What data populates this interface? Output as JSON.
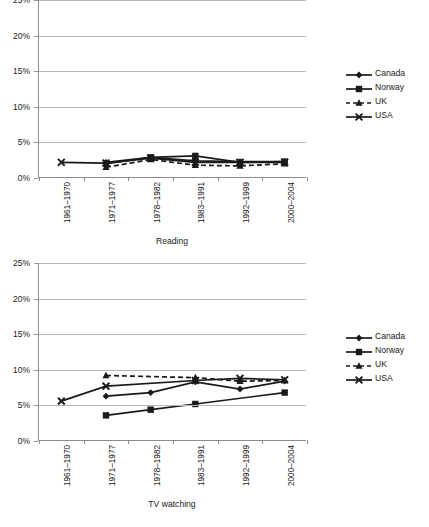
{
  "chart_data": [
    {
      "type": "line",
      "title": "",
      "xlabel": "Reading",
      "ylabel": "",
      "ylim": [
        0,
        25
      ],
      "yticks": [
        "0%",
        "5%",
        "10%",
        "15%",
        "20%",
        "25%"
      ],
      "ytick_values": [
        0,
        5,
        10,
        15,
        20,
        25
      ],
      "grid": true,
      "legend_position": "right",
      "categories": [
        "1961–1970",
        "1971–1977",
        "1978–1982",
        "1983–1991",
        "1992–1999",
        "2000–2004"
      ],
      "series": [
        {
          "name": "Canada",
          "marker": "diamond",
          "line": "solid",
          "values": [
            null,
            2.2,
            2.9,
            2.4,
            2.3,
            2.3
          ]
        },
        {
          "name": "Norway",
          "marker": "square",
          "line": "solid",
          "values": [
            null,
            2.0,
            2.9,
            3.1,
            2.2,
            2.3
          ]
        },
        {
          "name": "UK",
          "marker": "triangle",
          "line": "dashed",
          "values": [
            null,
            1.5,
            2.6,
            1.8,
            1.7,
            2.0
          ]
        },
        {
          "name": "USA",
          "marker": "x",
          "line": "solid",
          "values": [
            2.2,
            2.1,
            2.8,
            2.2,
            2.2,
            2.2
          ]
        }
      ]
    },
    {
      "type": "line",
      "title": "",
      "xlabel": "TV watching",
      "ylabel": "",
      "ylim": [
        0,
        25
      ],
      "yticks": [
        "0%",
        "5%",
        "10%",
        "15%",
        "20%",
        "25%"
      ],
      "ytick_values": [
        0,
        5,
        10,
        15,
        20,
        25
      ],
      "grid": true,
      "legend_position": "right",
      "categories": [
        "1961–1970",
        "1971–1977",
        "1978–1982",
        "1983–1991",
        "1992–1999",
        "2000–2004"
      ],
      "series": [
        {
          "name": "Canada",
          "marker": "diamond",
          "line": "solid",
          "values": [
            null,
            6.3,
            6.8,
            8.3,
            7.3,
            8.4
          ]
        },
        {
          "name": "Norway",
          "marker": "square",
          "line": "solid",
          "values": [
            null,
            3.6,
            4.4,
            5.2,
            null,
            6.8
          ]
        },
        {
          "name": "UK",
          "marker": "triangle",
          "line": "dashed",
          "values": [
            null,
            9.2,
            null,
            8.9,
            8.4,
            8.5
          ]
        },
        {
          "name": "USA",
          "marker": "x",
          "line": "solid",
          "values": [
            5.6,
            7.7,
            null,
            8.5,
            8.8,
            8.6
          ]
        }
      ]
    }
  ],
  "charts": [
    {
      "id": "reading",
      "axis_title": "Reading",
      "legend": [
        {
          "label": "Canada"
        },
        {
          "label": "Norway"
        },
        {
          "label": "UK"
        },
        {
          "label": "USA"
        }
      ]
    },
    {
      "id": "tv",
      "axis_title": "TV watching",
      "legend": [
        {
          "label": "Canada"
        },
        {
          "label": "Norway"
        },
        {
          "label": "UK"
        },
        {
          "label": "USA"
        }
      ]
    }
  ]
}
